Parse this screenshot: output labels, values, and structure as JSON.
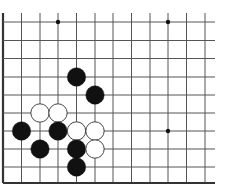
{
  "board": {
    "description": "Go board fragment (lower-left corner region)",
    "cols_x": [
      3,
      21.5,
      40,
      58,
      76.5,
      95,
      113,
      131.5,
      150,
      168,
      186.5,
      205
    ],
    "rows_y": [
      22,
      40.5,
      58.5,
      77,
      95,
      113,
      131,
      149,
      167,
      183
    ],
    "line_extent": {
      "top": 13,
      "right": 215
    },
    "left_edge_x": 3,
    "bottom_edge_y": 183,
    "line_color": "#555555",
    "edge_color": "#333333",
    "star_points": [
      {
        "col": 3,
        "row": 0
      },
      {
        "col": 9,
        "row": 0
      },
      {
        "col": 9,
        "row": 6
      }
    ],
    "stone_radius": 9.2,
    "stones": [
      {
        "color": "black",
        "col": 4,
        "row": 3
      },
      {
        "color": "black",
        "col": 5,
        "row": 4
      },
      {
        "color": "white",
        "col": 2,
        "row": 5
      },
      {
        "color": "white",
        "col": 3,
        "row": 5
      },
      {
        "color": "black",
        "col": 1,
        "row": 6
      },
      {
        "color": "black",
        "col": 3,
        "row": 6
      },
      {
        "color": "white",
        "col": 4,
        "row": 6
      },
      {
        "color": "white",
        "col": 5,
        "row": 6
      },
      {
        "color": "black",
        "col": 2,
        "row": 7
      },
      {
        "color": "black",
        "col": 4,
        "row": 7
      },
      {
        "color": "white",
        "col": 5,
        "row": 7
      },
      {
        "color": "black",
        "col": 4,
        "row": 8
      }
    ],
    "colors": {
      "black_stone": "#111111",
      "white_stone": "#ffffff",
      "white_outline": "#444444"
    }
  }
}
